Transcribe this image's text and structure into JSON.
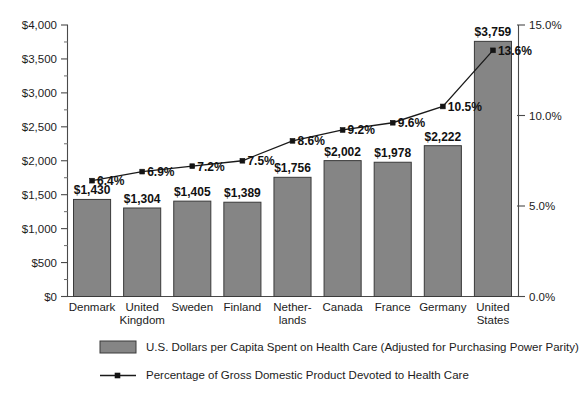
{
  "chart_data": {
    "type": "bar",
    "title": "",
    "subtitle": "",
    "xlabel": "",
    "ylabel": "",
    "y2label": "",
    "grid": false,
    "legend_position": "bottom",
    "categories": [
      "Denmark",
      "United Kingdom",
      "Sweden",
      "Finland",
      "Netherlands",
      "Canada",
      "France",
      "Germany",
      "United States"
    ],
    "category_lines": [
      [
        "Denmark"
      ],
      [
        "United",
        "Kingdom"
      ],
      [
        "Sweden"
      ],
      [
        "Finland"
      ],
      [
        "Nether-",
        "lands"
      ],
      [
        "Canada"
      ],
      [
        "France"
      ],
      [
        "Germany"
      ],
      [
        "United",
        "States"
      ]
    ],
    "series": [
      {
        "name": "U.S. Dollars per Capita Spent on Health Care (Adjusted for Purchasing Power Parity)",
        "type": "bar",
        "axis": "left",
        "color": "#858585",
        "values": [
          1430,
          1304,
          1405,
          1389,
          1756,
          2002,
          1978,
          2222,
          3759
        ],
        "labels": [
          "$1,430",
          "$1,304",
          "$1,405",
          "$1,389",
          "$1,756",
          "$2,002",
          "$1,978",
          "$2,222",
          "$3,759"
        ]
      },
      {
        "name": "Percentage of Gross Domestic Product Devoted to Health Care",
        "type": "line",
        "axis": "right",
        "color": "#1a1a1a",
        "values": [
          6.4,
          6.9,
          7.2,
          7.5,
          8.6,
          9.2,
          9.6,
          10.5,
          13.6
        ],
        "labels": [
          "6.4%",
          "6.9%",
          "7.2%",
          "7.5%",
          "8.6%",
          "9.2%",
          "9.6%",
          "10.5%",
          "13.6%"
        ]
      }
    ],
    "ylim": [
      0,
      4000
    ],
    "yticks": [
      0,
      500,
      1000,
      1500,
      2000,
      2500,
      3000,
      3500,
      4000
    ],
    "ytick_labels": [
      "$0",
      "$500",
      "$1,000",
      "$1,500",
      "$2,000",
      "$2,500",
      "$3,000",
      "$3,500",
      "$4,000"
    ],
    "y2lim": [
      0,
      15
    ],
    "y2ticks": [
      0,
      5,
      10,
      15
    ],
    "y2tick_labels": [
      "0.0%",
      "5.0%",
      "10.0%",
      "15.0%"
    ]
  },
  "legend": {
    "items": [
      {
        "marker": "swatch",
        "label": "U.S. Dollars per Capita Spent on Health Care (Adjusted for Purchasing Power Parity)"
      },
      {
        "marker": "line",
        "label": "Percentage of Gross Domestic Product Devoted to Health Care"
      }
    ]
  },
  "colors": {
    "bar_fill": "#858585",
    "bar_stroke": "#3a3a3a",
    "line": "#1a1a1a",
    "axis": "#4a4a4a",
    "text": "#1c1c1c",
    "background": "#ffffff"
  }
}
